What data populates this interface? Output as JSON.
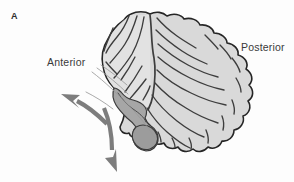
{
  "figure": {
    "panel_letter": "A",
    "kind": "anatomical-illustration",
    "background_color": "#fdfdfd"
  },
  "labels": {
    "anterior": "Anterior",
    "posterior": "Posterior"
  },
  "colors": {
    "cortex_fill": "#d9d9d9",
    "cortex_fill_light": "#e2e2e2",
    "deep_structure_fill": "#a6a6a6",
    "outline": "#262626",
    "fissure_line": "#3d3d3d",
    "arrow_gray": "#7d7d7d",
    "pointer_line": "#9a9a9a",
    "text": "#3a3a3a"
  },
  "annotations": {
    "arrow_upper_left": "curved-arrow-anterior-rotation",
    "arrow_lower": "curved-arrow-inferior-rotation",
    "pointer_lines": "thin-reference-lines"
  }
}
